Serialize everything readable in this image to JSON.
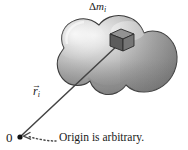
{
  "figure": {
    "background_color": "#ffffff",
    "width": 188,
    "height": 150
  },
  "labels": {
    "mass_element": {
      "delta": "Δ",
      "symbol": "m",
      "subscript": "i",
      "full": "Δm_i"
    },
    "position_vector": {
      "arrow": "→",
      "symbol": "r",
      "subscript": "i",
      "full": "r⃗_i"
    },
    "origin": {
      "marker": "0"
    },
    "caption": {
      "text": "Origin is arbitrary."
    }
  },
  "colors": {
    "body_outline": "#3a3a3a",
    "body_fill_light": "#e2e2e2",
    "body_fill_mid": "#a8a8a8",
    "body_fill_dark": "#7c7c7c",
    "cube_top": "#8e8e8e",
    "cube_front": "#5e5e5e",
    "cube_side": "#6e6e6e",
    "cube_edge": "#2a2a2a",
    "vector_line": "#444444",
    "origin_dot": "#111111",
    "caption_arrow": "#4a4a4a",
    "text": "#1a1a1a"
  },
  "geometry": {
    "origin_point": {
      "x": 20,
      "y": 137
    },
    "mass_element_point": {
      "x": 120,
      "y": 43
    },
    "caption_arrow_from": {
      "x": 57,
      "y": 140
    },
    "caption_arrow_to": {
      "x": 25,
      "y": 136
    }
  },
  "icons": {
    "mass_cube": "cube-icon",
    "origin_dot": "origin-dot-icon",
    "vector_arrow": "vector-line-icon",
    "dotted_pointer": "dotted-arrow-icon",
    "rigid_body": "blob-shape-icon"
  }
}
